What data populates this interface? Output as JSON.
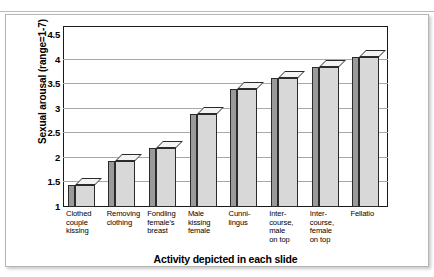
{
  "chart_data": {
    "type": "bar",
    "title": "",
    "subtitle": "",
    "xlabel": "Activity depicted in each slide",
    "ylabel": "Sexual arousal (range=1-7)",
    "ylim": [
      1,
      4.5
    ],
    "yticks": [
      "1",
      "1.5",
      "2",
      "2.5",
      "3",
      "3.5",
      "4",
      "4.5"
    ],
    "ytick_values": [
      1,
      1.5,
      2,
      2.5,
      3,
      3.5,
      4,
      4.5
    ],
    "grid": true,
    "legend": "none",
    "style": "3d-bar",
    "categories": [
      "Clothed couple kissing",
      "Removing clothing",
      "Fondling female's breast",
      "Male kissing female",
      "Cunnilingus",
      "Intercourse, male on top",
      "Intercourse, female on top",
      "Fellatio"
    ],
    "category_lines": [
      [
        "Clothed",
        "couple",
        "kissing"
      ],
      [
        "Removing",
        "clothing"
      ],
      [
        "Fondling",
        "female's",
        "breast"
      ],
      [
        "Male",
        "kissing",
        "female"
      ],
      [
        "Cunni-",
        "lingus"
      ],
      [
        "Inter-",
        "course,",
        "male",
        "on top"
      ],
      [
        "Inter-",
        "course,",
        "female",
        "on top"
      ],
      [
        "Fellatio"
      ]
    ],
    "values": [
      1.45,
      1.93,
      2.2,
      2.9,
      3.4,
      3.62,
      3.85,
      4.05
    ]
  },
  "colors": {
    "bar_front": "#d8d8d8",
    "bar_side": "#9a9a9a",
    "bar_top": "#f3f3f3",
    "bar_outline": "#2b2b2b",
    "gridline": "#a8a8a8",
    "axis": "#1a1a1a",
    "background": "#ffffff"
  }
}
